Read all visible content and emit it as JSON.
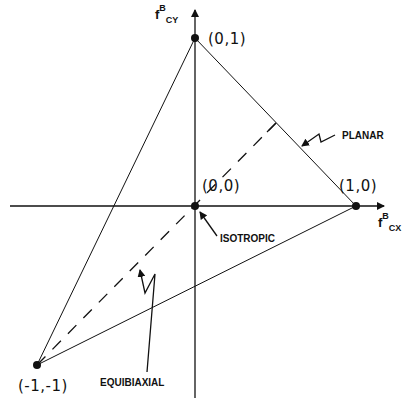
{
  "diagram": {
    "type": "ternary-like stress state diagram",
    "axes": {
      "x": {
        "label_main": "f",
        "label_super": "B",
        "label_sub": "CX"
      },
      "y": {
        "label_main": "f",
        "label_super": "B",
        "label_sub": "CY"
      }
    },
    "points": [
      {
        "id": "p01",
        "label": "(0,1)",
        "x": 0,
        "y": 1
      },
      {
        "id": "p10",
        "label": "(1,0)",
        "x": 1,
        "y": 0
      },
      {
        "id": "p00",
        "label": "(0,0)",
        "x": 0,
        "y": 0
      },
      {
        "id": "pm1m1",
        "label": "(-1,-1)",
        "x": -1,
        "y": -1
      }
    ],
    "annotations": {
      "planar": "PLANAR",
      "isotropic": "ISOTROPIC",
      "equibiaxial": "EQUIBIAXIAL"
    },
    "colors": {
      "ink": "#111111",
      "background": "#ffffff"
    }
  }
}
